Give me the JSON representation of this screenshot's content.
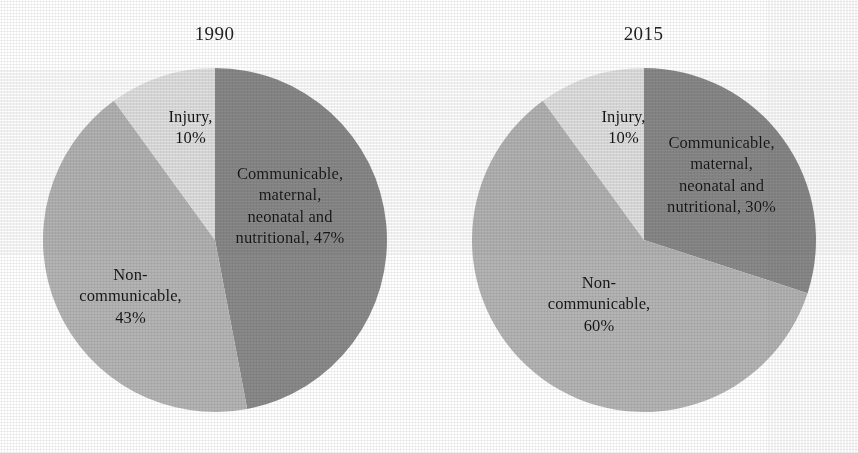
{
  "figure": {
    "background_color": "#ffffff",
    "width": 858,
    "height": 453
  },
  "palette": {
    "communicable": "#8a8a8a",
    "noncommunicable": "#b4b4b4",
    "injury": "#e2e2e2",
    "text": "#151515",
    "title": "#232323"
  },
  "chart_data": [
    {
      "type": "pie",
      "title": "1990",
      "categories": [
        "Communicable, maternal, neonatal and nutritional",
        "Non-communicable",
        "Injury"
      ],
      "values": [
        47,
        43,
        10
      ],
      "unit": "%",
      "start_angle_deg": 0,
      "direction": "clockwise",
      "colors": [
        "#8a8a8a",
        "#b4b4b4",
        "#e2e2e2"
      ],
      "legend": "none",
      "labels_inside": true,
      "slice_labels": [
        "Communicable,\nmaternal,\nneonatal and\nnutritional, 47%",
        "Non-\ncommunicable,\n43%",
        "Injury,\n10%"
      ],
      "xlabel": "",
      "ylabel": ""
    },
    {
      "type": "pie",
      "title": "2015",
      "categories": [
        "Communicable, maternal, neonatal and nutritional",
        "Non-communicable",
        "Injury"
      ],
      "values": [
        30,
        60,
        10
      ],
      "unit": "%",
      "start_angle_deg": 0,
      "direction": "clockwise",
      "colors": [
        "#8a8a8a",
        "#b4b4b4",
        "#e2e2e2"
      ],
      "legend": "none",
      "labels_inside": true,
      "slice_labels": [
        "Communicable,\nmaternal,\nneonatal and\nnutritional, 30%",
        "Non-\ncommunicable,\n60%",
        "Injury,\n10%"
      ],
      "xlabel": "",
      "ylabel": ""
    }
  ],
  "panels": {
    "p1990": {
      "title": "1990",
      "injury_label": "Injury,\n10%",
      "communicable_label": "Communicable,\nmaternal,\nneonatal and\nnutritional, 47%",
      "noncommunicable_label": "Non-\ncommunicable,\n43%"
    },
    "p2015": {
      "title": "2015",
      "injury_label": "Injury,\n10%",
      "communicable_label": "Communicable,\nmaternal,\nneonatal and\nnutritional, 30%",
      "noncommunicable_label": "Non-\ncommunicable,\n60%"
    }
  }
}
